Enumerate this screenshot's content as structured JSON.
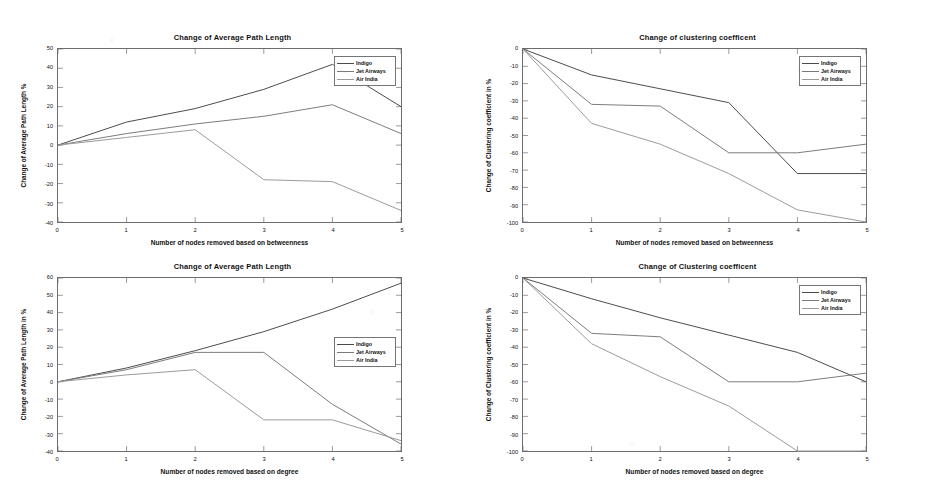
{
  "figure": {
    "width": 930,
    "height": 504,
    "background": "#ffffff",
    "layout": "2x2 grid of line charts"
  },
  "series_colors": {
    "Indigo": "#4a4a4a",
    "Jet Airways": "#7a7a7a",
    "Air India": "#9a9a9a"
  },
  "legend_entries": [
    "Indigo",
    "Jet Airways",
    "Air India"
  ],
  "chart_data": [
    {
      "id": "top-left",
      "type": "line",
      "title": "Change of Average Path Length",
      "xlabel": "Number of nodes removed based on betweenness",
      "ylabel": "Change of Average Path Length %",
      "x": [
        0,
        1,
        2,
        3,
        4,
        5
      ],
      "xtick_labels": [
        "0",
        "1",
        "2",
        "3",
        "4",
        "5"
      ],
      "ytick_labels": [
        "50",
        "40",
        "30",
        "20",
        "10",
        "0",
        "-10",
        "-20",
        "-30",
        "-40"
      ],
      "xlim": [
        0,
        5
      ],
      "ylim": [
        -40,
        50
      ],
      "grid": false,
      "legend_position": "upper right",
      "series": [
        {
          "name": "Indigo",
          "values": [
            0,
            12,
            19,
            29,
            42,
            20
          ]
        },
        {
          "name": "Jet Airways",
          "values": [
            0,
            6,
            11,
            15,
            21,
            6
          ]
        },
        {
          "name": "Air India",
          "values": [
            0,
            4,
            8,
            -18,
            -19,
            -34
          ]
        }
      ]
    },
    {
      "id": "top-right",
      "type": "line",
      "title": "Change of clustering coefficent",
      "xlabel": "Number of nodes removed based on betweenness",
      "ylabel": "Change of Clustering coefficient in %",
      "x": [
        0,
        1,
        2,
        3,
        4,
        5
      ],
      "xtick_labels": [
        "0",
        "1",
        "2",
        "3",
        "4",
        "5"
      ],
      "ytick_labels": [
        "0",
        "-10",
        "-20",
        "-30",
        "-40",
        "-50",
        "-60",
        "-70",
        "-80",
        "-90",
        "-100"
      ],
      "xlim": [
        0,
        5
      ],
      "ylim": [
        -100,
        0
      ],
      "grid": false,
      "legend_position": "upper right",
      "series": [
        {
          "name": "Indigo",
          "values": [
            0,
            -15,
            -23,
            -31,
            -72,
            -72
          ]
        },
        {
          "name": "Jet Airways",
          "values": [
            0,
            -32,
            -33,
            -60,
            -60,
            -55
          ]
        },
        {
          "name": "Air India",
          "values": [
            0,
            -43,
            -55,
            -72,
            -93,
            -100
          ]
        }
      ]
    },
    {
      "id": "bottom-left",
      "type": "line",
      "title": "Change of Average Path Length",
      "xlabel": "Number of nodes removed based on degree",
      "ylabel": "Change of Average Path Length in %",
      "x": [
        0,
        1,
        2,
        3,
        4,
        5
      ],
      "xtick_labels": [
        "0",
        "1",
        "2",
        "3",
        "4",
        "5"
      ],
      "ytick_labels": [
        "60",
        "50",
        "40",
        "30",
        "20",
        "10",
        "0",
        "-10",
        "-20",
        "-30",
        "-40"
      ],
      "xlim": [
        0,
        5
      ],
      "ylim": [
        -40,
        60
      ],
      "grid": false,
      "legend_position": "upper right",
      "series": [
        {
          "name": "Indigo",
          "values": [
            0,
            8,
            18,
            29,
            42,
            57
          ]
        },
        {
          "name": "Jet Airways",
          "values": [
            0,
            7,
            17,
            17,
            -13,
            -36
          ]
        },
        {
          "name": "Air India",
          "values": [
            0,
            4,
            7,
            -22,
            -22,
            -34
          ]
        }
      ]
    },
    {
      "id": "bottom-right",
      "type": "line",
      "title": "Change of Clustering coefficent",
      "xlabel": "Number of nodes removed based on degree",
      "ylabel": "Change of Clustering coefficient in %",
      "x": [
        0,
        1,
        2,
        3,
        4,
        5
      ],
      "xtick_labels": [
        "0",
        "1",
        "2",
        "3",
        "4",
        "5"
      ],
      "ytick_labels": [
        "0",
        "-10",
        "-20",
        "-30",
        "-40",
        "-50",
        "-60",
        "-70",
        "-80",
        "-90",
        "-100"
      ],
      "xlim": [
        0,
        5
      ],
      "ylim": [
        -100,
        0
      ],
      "grid": false,
      "legend_position": "upper right",
      "series": [
        {
          "name": "Indigo",
          "values": [
            0,
            -12,
            -23,
            -33,
            -43,
            -60
          ]
        },
        {
          "name": "Jet Airways",
          "values": [
            0,
            -32,
            -34,
            -60,
            -60,
            -55
          ]
        },
        {
          "name": "Air India",
          "values": [
            0,
            -38,
            -57,
            -74,
            -100,
            -100
          ]
        }
      ]
    }
  ]
}
